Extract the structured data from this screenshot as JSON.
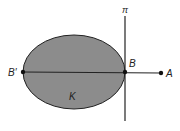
{
  "diagram": {
    "labels": {
      "plane": "π",
      "point_b": "B",
      "point_b_prime": "B′",
      "point_a": "A",
      "region": "K"
    },
    "colors": {
      "fill": "#8c8c8c",
      "stroke": "#222222",
      "background": "#ffffff"
    }
  }
}
